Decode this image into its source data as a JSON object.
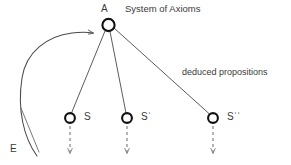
{
  "diagram": {
    "title_label": "System of Axioms",
    "edge_label": "deduced propositions",
    "root": {
      "id": "A",
      "label": "A"
    },
    "source": {
      "id": "E",
      "label": "E"
    },
    "nodes": [
      {
        "id": "S",
        "label": "S"
      },
      {
        "id": "S1",
        "label": "Sˈ"
      },
      {
        "id": "S2",
        "label": "Sˈˈ"
      }
    ],
    "colors": {
      "background": "#ffffff",
      "node_stroke": "#111111",
      "node_fill": "#ffffff",
      "connector": "#4a4a4a",
      "curve": "#4a4a4a",
      "dashed": "#6b6b6b",
      "text": "#3a3a3a"
    }
  }
}
